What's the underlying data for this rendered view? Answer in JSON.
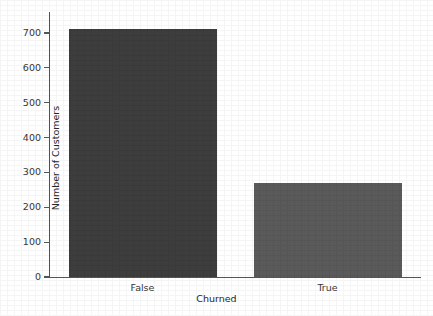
{
  "chart_data": {
    "type": "bar",
    "title": "",
    "xlabel": "Churned",
    "ylabel": "Number of Customers",
    "categories": [
      "False",
      "True"
    ],
    "values": [
      710,
      269
    ],
    "ylim": [
      0,
      760
    ],
    "yticks": [
      0,
      100,
      200,
      300,
      400,
      500,
      600,
      700
    ],
    "ytick_labels": [
      "0",
      "100",
      "200",
      "300",
      "400",
      "500",
      "600",
      "700"
    ],
    "grid": false,
    "legend": null,
    "bar_colors": [
      "#3d3d3d",
      "#5a5a5a"
    ],
    "axis_color": "#555555",
    "background": "#ffffff"
  }
}
